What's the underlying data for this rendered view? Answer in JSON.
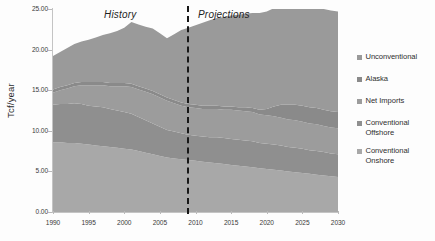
{
  "chart_data": {
    "type": "area",
    "stacked": true,
    "title": "",
    "xlabel": "",
    "ylabel": "Tcf/year",
    "xlim": [
      1990,
      2030
    ],
    "ylim": [
      0,
      25
    ],
    "grid": false,
    "legend_position": "right",
    "xticks": [
      1990,
      1995,
      2000,
      2005,
      2010,
      2015,
      2020,
      2025,
      2030
    ],
    "xtick_labels": [
      "1990",
      "1995",
      "2000",
      "2005",
      "2010",
      "2015",
      "2020",
      "2025",
      "2030"
    ],
    "yticks": [
      0,
      5,
      10,
      15,
      20,
      25
    ],
    "ytick_labels": [
      "0.00",
      "5.00",
      "10.00",
      "15.00",
      "20.00",
      "25.00"
    ],
    "annotations": [
      {
        "text": "History",
        "x": 1997.5,
        "style": "italic"
      },
      {
        "text": "Projections",
        "x": 2014.0,
        "style": "italic"
      }
    ],
    "divider": {
      "x": 2008.5,
      "style": "dashed",
      "color": "#171717"
    },
    "x": [
      1990,
      1991,
      1992,
      1993,
      1994,
      1995,
      1996,
      1997,
      1998,
      1999,
      2000,
      2001,
      2002,
      2003,
      2004,
      2005,
      2006,
      2007,
      2008,
      2009,
      2010,
      2011,
      2012,
      2013,
      2014,
      2015,
      2016,
      2017,
      2018,
      2019,
      2020,
      2021,
      2022,
      2023,
      2024,
      2025,
      2026,
      2027,
      2028,
      2029,
      2030
    ],
    "series": [
      {
        "name": "Conventional Onshore",
        "color": "#a8a8a8",
        "values": [
          8.6,
          8.6,
          8.5,
          8.5,
          8.4,
          8.3,
          8.2,
          8.1,
          8.0,
          7.9,
          7.8,
          7.7,
          7.5,
          7.3,
          7.1,
          6.9,
          6.7,
          6.6,
          6.5,
          6.4,
          6.3,
          6.2,
          6.1,
          6.0,
          5.9,
          5.8,
          5.7,
          5.6,
          5.5,
          5.4,
          5.3,
          5.2,
          5.1,
          5.0,
          4.9,
          4.8,
          4.7,
          4.6,
          4.5,
          4.4,
          4.3
        ]
      },
      {
        "name": "Conventional Offshore",
        "color": "#8f8f8f",
        "values": [
          4.6,
          4.7,
          4.8,
          4.9,
          4.9,
          4.8,
          4.8,
          4.8,
          4.7,
          4.6,
          4.5,
          4.4,
          4.2,
          4.0,
          3.8,
          3.6,
          3.4,
          3.3,
          3.2,
          3.1,
          3.1,
          3.1,
          3.1,
          3.2,
          3.2,
          3.2,
          3.2,
          3.2,
          3.2,
          3.1,
          3.1,
          3.1,
          3.1,
          3.0,
          3.0,
          3.0,
          2.9,
          2.9,
          2.9,
          2.8,
          2.8
        ]
      },
      {
        "name": "Net Imports",
        "color": "#9c9c9c",
        "values": [
          1.5,
          1.7,
          1.9,
          2.1,
          2.3,
          2.5,
          2.6,
          2.7,
          2.8,
          3.0,
          3.2,
          3.3,
          3.4,
          3.5,
          3.6,
          3.6,
          3.6,
          3.5,
          3.4,
          3.4,
          3.4,
          3.4,
          3.5,
          3.5,
          3.5,
          3.6,
          3.6,
          3.6,
          3.6,
          3.5,
          3.5,
          3.5,
          3.4,
          3.4,
          3.4,
          3.3,
          3.3,
          3.3,
          3.2,
          3.2,
          3.2
        ]
      },
      {
        "name": "Alaska",
        "color": "#8a8a8a",
        "values": [
          0.4,
          0.4,
          0.4,
          0.4,
          0.4,
          0.4,
          0.4,
          0.4,
          0.4,
          0.4,
          0.4,
          0.4,
          0.4,
          0.4,
          0.4,
          0.4,
          0.4,
          0.4,
          0.4,
          0.4,
          0.4,
          0.4,
          0.4,
          0.4,
          0.4,
          0.4,
          0.4,
          0.5,
          0.5,
          0.6,
          0.8,
          1.2,
          1.6,
          1.8,
          1.9,
          2.0,
          2.0,
          2.0,
          2.0,
          2.0,
          2.0
        ]
      },
      {
        "name": "Unconventional",
        "color": "#9a9a9a",
        "values": [
          4.1,
          4.3,
          4.6,
          4.8,
          5.0,
          5.2,
          5.5,
          5.8,
          6.1,
          6.4,
          6.8,
          7.6,
          7.6,
          7.6,
          7.7,
          7.5,
          7.3,
          8.1,
          8.9,
          9.4,
          9.8,
          10.2,
          10.5,
          10.8,
          11.0,
          11.2,
          11.4,
          11.5,
          11.7,
          11.9,
          12.0,
          12.1,
          12.2,
          12.3,
          12.4,
          12.5,
          12.5,
          12.5,
          12.4,
          12.4,
          12.4
        ]
      }
    ]
  },
  "legend": {
    "items": [
      {
        "label": "Unconventional"
      },
      {
        "label": "Alaska"
      },
      {
        "label": "Net Imports"
      },
      {
        "label": "Conventional Offshore"
      },
      {
        "label": "Conventional Onshore"
      }
    ]
  }
}
